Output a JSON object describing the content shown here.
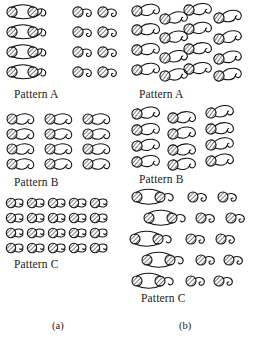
{
  "figure": {
    "type": "schematic-illustration",
    "ink_color": "#1a1a1a",
    "background_color": "#ffffff",
    "hatch_color": "#4a4a4a"
  },
  "columns": [
    {
      "id": "a",
      "caption": "(a)",
      "panels": [
        {
          "id": "a-pattern-a",
          "label": "Pattern A",
          "rows": 4,
          "motifs_per_row": 4,
          "arrangement": "regular grid, two linked pairs per row, all motifs upright and aligned"
        },
        {
          "id": "a-pattern-b",
          "label": "Pattern B",
          "rows": 4,
          "motifs_per_row": 3,
          "arrangement": "regular grid, three motifs per row, tails curling to the right"
        },
        {
          "id": "a-pattern-c",
          "label": "Pattern C",
          "rows": 4,
          "motifs_per_row": 5,
          "arrangement": "dense continuous chain, motifs touching end to end across each row"
        }
      ]
    },
    {
      "id": "b",
      "caption": "(b)",
      "panels": [
        {
          "id": "b-pattern-a",
          "label": "Pattern A",
          "rows": 4,
          "motifs_per_row": 4,
          "arrangement": "staggered / offset grid, motifs tilted at varying angles"
        },
        {
          "id": "b-pattern-b",
          "label": "Pattern B",
          "rows": 4,
          "motifs_per_row": 3,
          "arrangement": "offset grid, mixed orientations, looser spacing"
        },
        {
          "id": "b-pattern-c",
          "label": "Pattern C",
          "rows": 5,
          "motifs_per_row": 4,
          "arrangement": "scattered rows, linked pairs at left and single motifs at right, horizontally offset"
        }
      ]
    }
  ]
}
